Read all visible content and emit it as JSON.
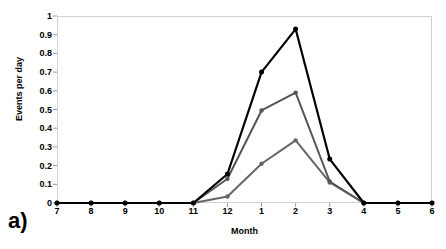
{
  "panel": {
    "letter": "a)"
  },
  "chart_data": {
    "type": "line",
    "title": "",
    "xlabel": "Month",
    "ylabel": "Events per day",
    "categories": [
      "7",
      "8",
      "9",
      "10",
      "11",
      "12",
      "1",
      "2",
      "3",
      "4",
      "5",
      "6"
    ],
    "x": [
      7,
      8,
      9,
      10,
      11,
      12,
      1,
      2,
      3,
      4,
      5,
      6
    ],
    "ylim": [
      0,
      1
    ],
    "yticks": [
      "0",
      "0.1",
      "0.2",
      "0.3",
      "0.4",
      "0.5",
      "0.6",
      "0.7",
      "0.8",
      "0.9",
      "1"
    ],
    "ytick_values": [
      0,
      0.1,
      0.2,
      0.3,
      0.4,
      0.5,
      0.6,
      0.7,
      0.8,
      0.9,
      1
    ],
    "grid": false,
    "legend": "none",
    "markers": "filled-circle",
    "series": [
      {
        "name": "series-1",
        "color": "#000000",
        "values": [
          0,
          0,
          0,
          0,
          0,
          0.155,
          0.7,
          0.93,
          0.235,
          0,
          0,
          0
        ]
      },
      {
        "name": "series-2",
        "color": "#555555",
        "values": [
          0,
          0,
          0,
          0,
          0,
          0.13,
          0.495,
          0.59,
          0.115,
          0,
          0,
          0
        ]
      },
      {
        "name": "series-3",
        "color": "#666666",
        "values": [
          0,
          0,
          0,
          0,
          0,
          0.035,
          0.21,
          0.335,
          0.11,
          0,
          0,
          0
        ]
      }
    ]
  }
}
